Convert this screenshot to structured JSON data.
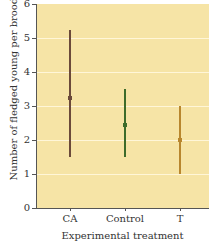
{
  "chart_data": {
    "type": "errorbar",
    "title": "",
    "xlabel": "Experimental treatment",
    "ylabel": "Number of fledged young per brood",
    "categories": [
      "CA",
      "Control",
      "T"
    ],
    "series": [
      {
        "name": "mean",
        "values": [
          3.25,
          2.45,
          2.0
        ]
      },
      {
        "name": "lower",
        "values": [
          1.5,
          1.5,
          1.0
        ]
      },
      {
        "name": "upper",
        "values": [
          5.25,
          3.5,
          3.0
        ]
      }
    ],
    "colors": [
      "#6b4a3a",
      "#3d6b2a",
      "#b8862e"
    ],
    "ylim": [
      0,
      6
    ],
    "yticks": [
      "0",
      "1",
      "2",
      "3",
      "4",
      "5",
      "6"
    ],
    "grid": true,
    "background": "#f6e4a6"
  }
}
